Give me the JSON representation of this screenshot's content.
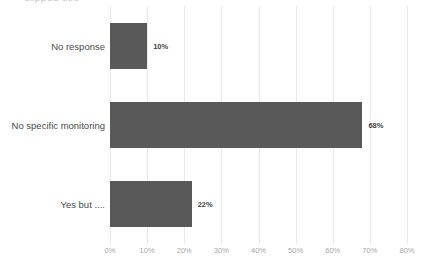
{
  "chart_data": {
    "type": "bar",
    "orientation": "horizontal",
    "title": "",
    "xlabel": "",
    "ylabel": "",
    "categories": [
      "No response",
      "No specific monitoring",
      "Yes but ...."
    ],
    "values": [
      10,
      68,
      22
    ],
    "data_labels": [
      "10%",
      "68%",
      "22%"
    ],
    "xlim": [
      0,
      80
    ],
    "xticks": [
      0,
      10,
      20,
      30,
      40,
      50,
      60,
      70,
      80
    ],
    "xtick_labels": [
      "0%",
      "10%",
      "20%",
      "30%",
      "40%",
      "50%",
      "60%",
      "70%",
      "80%"
    ],
    "grid": "vertical",
    "legend": "none",
    "series": [
      {
        "name": "",
        "values": [
          10,
          68,
          22
        ]
      }
    ]
  },
  "style": {
    "bar_color": "#595959",
    "gridline_color": "#e9e9ea",
    "background_color": "#ffffff",
    "tick_label_color": "#a6a6a6",
    "category_label_color": "#4a4a4a",
    "data_label_color": "#3f3f3f"
  },
  "title_fragment": {
    "text": "clipped title"
  }
}
